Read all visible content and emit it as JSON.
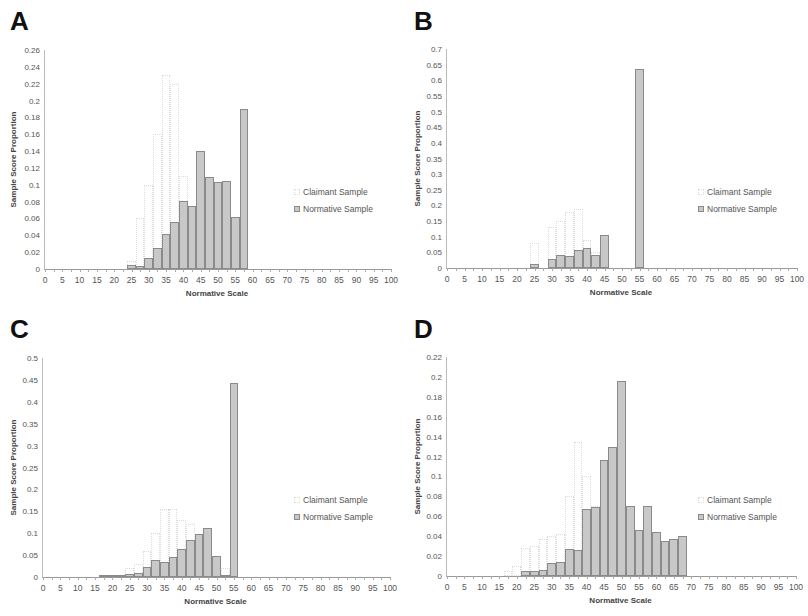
{
  "chart_data": [
    {
      "panel": "A",
      "type": "bar",
      "title": "",
      "xlabel": "Normative Scale",
      "ylabel": "Sample Score Proportion",
      "xlim": [
        0,
        100
      ],
      "ylim": [
        0,
        0.26
      ],
      "x_ticks": [
        "0",
        "5",
        "10",
        "15",
        "20",
        "25",
        "30",
        "35",
        "40",
        "45",
        "50",
        "55",
        "60",
        "65",
        "70",
        "75",
        "80",
        "85",
        "90",
        "95",
        "100"
      ],
      "y_ticks": [
        "0",
        "0.02",
        "0.04",
        "0.06",
        "0.08",
        "0.1",
        "0.12",
        "0.14",
        "0.16",
        "0.18",
        "0.2",
        "0.22",
        "0.24",
        "0.26"
      ],
      "bin_width": 2.5,
      "legend": [
        "Claimant Sample",
        "Normative Sample"
      ],
      "legend_position": "right",
      "grid": false,
      "series": [
        {
          "name": "Claimant Sample",
          "x": [
            25,
            27.5,
            30,
            32.5,
            35,
            37.5,
            40,
            42.5
          ],
          "values": [
            0.01,
            0.06,
            0.1,
            0.16,
            0.23,
            0.22,
            0.11,
            0.04
          ]
        },
        {
          "name": "Normative Sample",
          "x": [
            25,
            27.5,
            30,
            32.5,
            35,
            37.5,
            40,
            42.5,
            45,
            47.5,
            50,
            52.5,
            55,
            57.5
          ],
          "values": [
            0.005,
            0.004,
            0.013,
            0.025,
            0.042,
            0.056,
            0.081,
            0.075,
            0.14,
            0.109,
            0.103,
            0.104,
            0.062,
            0.19
          ]
        }
      ]
    },
    {
      "panel": "B",
      "type": "bar",
      "title": "",
      "xlabel": "Normative Scale",
      "ylabel": "Sample Score Proportion",
      "xlim": [
        0,
        100
      ],
      "ylim": [
        0,
        0.7
      ],
      "x_ticks": [
        "0",
        "5",
        "10",
        "15",
        "20",
        "25",
        "30",
        "35",
        "40",
        "45",
        "50",
        "55",
        "60",
        "65",
        "70",
        "75",
        "80",
        "85",
        "90",
        "95",
        "100"
      ],
      "y_ticks": [
        "0",
        "0.05",
        "0.1",
        "0.15",
        "0.2",
        "0.25",
        "0.3",
        "0.35",
        "0.4",
        "0.45",
        "0.5",
        "0.55",
        "0.6",
        "0.65",
        "0.7"
      ],
      "bin_width": 2.5,
      "legend": [
        "Claimant Sample",
        "Normative Sample"
      ],
      "legend_position": "right",
      "grid": false,
      "series": [
        {
          "name": "Claimant Sample",
          "x": [
            25,
            30,
            32.5,
            35,
            37.5,
            40,
            42.5
          ],
          "values": [
            0.08,
            0.13,
            0.15,
            0.18,
            0.19,
            0.09,
            0.05
          ]
        },
        {
          "name": "Normative Sample",
          "x": [
            25,
            30,
            32.5,
            35,
            37.5,
            40,
            42.5,
            45,
            55
          ],
          "values": [
            0.014,
            0.028,
            0.042,
            0.04,
            0.056,
            0.064,
            0.042,
            0.107,
            0.635
          ]
        }
      ]
    },
    {
      "panel": "C",
      "type": "bar",
      "title": "",
      "xlabel": "Normative Scale",
      "ylabel": "Sample Score Proportion",
      "xlim": [
        0,
        100
      ],
      "ylim": [
        0,
        0.5
      ],
      "x_ticks": [
        "0",
        "5",
        "10",
        "15",
        "20",
        "25",
        "30",
        "35",
        "40",
        "45",
        "50",
        "55",
        "60",
        "65",
        "70",
        "75",
        "80",
        "85",
        "90",
        "95",
        "100"
      ],
      "y_ticks": [
        "0",
        "0.05",
        "0.1",
        "0.15",
        "0.2",
        "0.25",
        "0.3",
        "0.35",
        "0.4",
        "0.45",
        "0.5"
      ],
      "bin_width": 2.5,
      "legend": [
        "Claimant Sample",
        "Normative Sample"
      ],
      "legend_position": "right",
      "grid": false,
      "series": [
        {
          "name": "Claimant Sample",
          "x": [
            25,
            27.5,
            30,
            32.5,
            35,
            37.5,
            40,
            42.5,
            45,
            47.5,
            50,
            52.5
          ],
          "values": [
            0.02,
            0.03,
            0.06,
            0.1,
            0.155,
            0.155,
            0.13,
            0.12,
            0.08,
            0.05,
            0.02,
            0.02
          ]
        },
        {
          "name": "Normative Sample",
          "x": [
            17.5,
            20,
            22.5,
            25,
            27.5,
            30,
            32.5,
            35,
            37.5,
            40,
            42.5,
            45,
            47.5,
            50,
            52.5,
            55
          ],
          "values": [
            0.001,
            0.002,
            0.002,
            0.007,
            0.01,
            0.023,
            0.038,
            0.035,
            0.046,
            0.065,
            0.085,
            0.098,
            0.113,
            0.047,
            0.002,
            0.442
          ]
        }
      ]
    },
    {
      "panel": "D",
      "type": "bar",
      "title": "",
      "xlabel": "Normative Scale",
      "ylabel": "Sample Score Proportion",
      "xlim": [
        0,
        100
      ],
      "ylim": [
        0,
        0.22
      ],
      "x_ticks": [
        "0",
        "5",
        "10",
        "15",
        "20",
        "25",
        "30",
        "35",
        "40",
        "45",
        "50",
        "55",
        "60",
        "65",
        "70",
        "75",
        "80",
        "85",
        "90",
        "95",
        "100"
      ],
      "y_ticks": [
        "0",
        "0.02",
        "0.04",
        "0.06",
        "0.08",
        "0.1",
        "0.12",
        "0.14",
        "0.16",
        "0.18",
        "0.2",
        "0.22"
      ],
      "bin_width": 2.5,
      "legend": [
        "Claimant Sample",
        "Normative Sample"
      ],
      "legend_position": "right",
      "grid": false,
      "series": [
        {
          "name": "Claimant Sample",
          "x": [
            17.5,
            20,
            22.5,
            25,
            27.5,
            30,
            32.5,
            35,
            37.5,
            40,
            42.5,
            45,
            47.5,
            50,
            52.5,
            55,
            57.5,
            60,
            62.5,
            65
          ],
          "values": [
            0.005,
            0.01,
            0.028,
            0.03,
            0.037,
            0.04,
            0.042,
            0.08,
            0.135,
            0.1,
            0.07,
            0.04,
            0.03,
            0.02,
            0.015,
            0.012,
            0.01,
            0.01,
            0.01,
            0.01
          ]
        },
        {
          "name": "Normative Sample",
          "x": [
            22.5,
            25,
            27.5,
            30,
            32.5,
            35,
            37.5,
            40,
            42.5,
            45,
            47.5,
            50,
            52.5,
            55,
            57.5,
            60,
            62.5,
            65,
            67.5
          ],
          "values": [
            0.005,
            0.005,
            0.006,
            0.013,
            0.014,
            0.027,
            0.026,
            0.067,
            0.069,
            0.117,
            0.13,
            0.196,
            0.07,
            0.046,
            0.07,
            0.044,
            0.035,
            0.037,
            0.04
          ]
        }
      ]
    }
  ]
}
